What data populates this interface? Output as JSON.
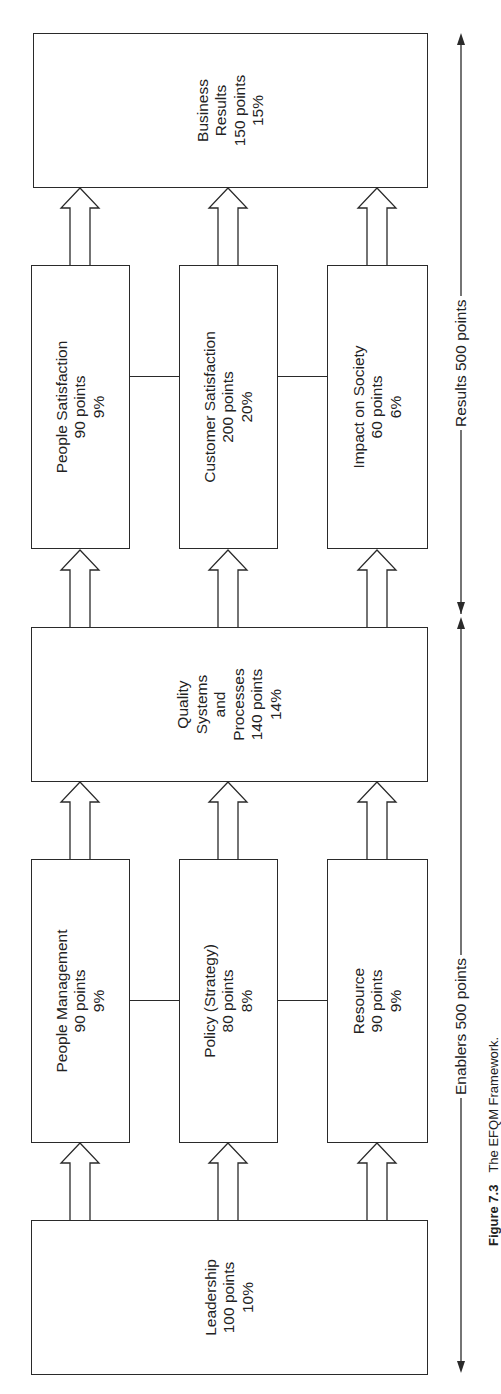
{
  "diagram": {
    "title": "The EFQM Framework",
    "caption": {
      "figure": "Figure 7.3",
      "text": "The EFQM Framework."
    },
    "enablers_label": "Enablers 500 points",
    "results_label": "Results 500 points",
    "boxes": {
      "leadership": {
        "name": "Leadership",
        "points": "100 points",
        "percent": "10%"
      },
      "people_management": {
        "name": "People Management",
        "points": "90 points",
        "percent": "9%"
      },
      "policy_strategy": {
        "name": "Policy (Strategy)",
        "points": "80 points",
        "percent": "8%"
      },
      "resource": {
        "name": "Resource",
        "points": "90 points",
        "percent": "9%"
      },
      "quality_systems": {
        "name_line1": "Quality",
        "name_line2": "Systems",
        "name_line3": "and",
        "name_line4": "Processes",
        "points": "140 points",
        "percent": "14%"
      },
      "people_satisfaction": {
        "name": "People Satisfaction",
        "points": "90 points",
        "percent": "9%"
      },
      "customer_satisfaction": {
        "name": "Customer Satisfaction",
        "points": "200 points",
        "percent": "20%"
      },
      "impact_on_society": {
        "name": "Impact on Society",
        "points": "60 points",
        "percent": "6%"
      },
      "business_results": {
        "name_line1": "Business",
        "name_line2": "Results",
        "points": "150 points",
        "percent": "15%"
      }
    },
    "colors": {
      "line": "#2a2a2a",
      "text": "#222222",
      "background": "#ffffff"
    }
  }
}
